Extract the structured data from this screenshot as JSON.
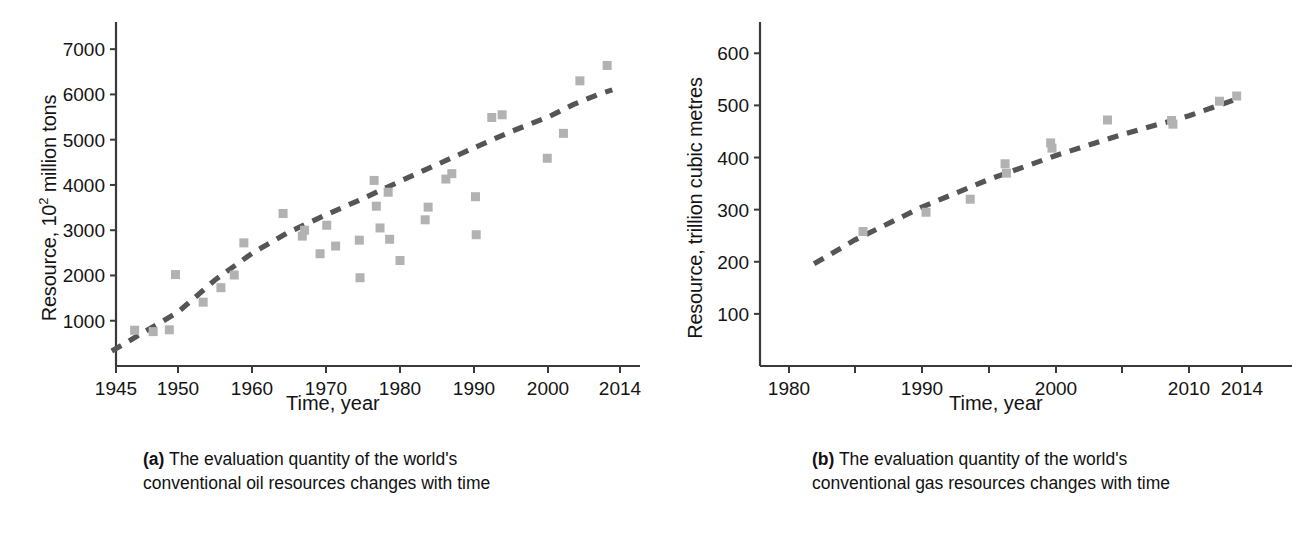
{
  "figure": {
    "panels": [
      {
        "id": "panel-a",
        "caption_tag": "(a)",
        "caption_text": " The evaluation quantity of the world's\nconventional oil resources changes with time",
        "chart_data": {
          "type": "scatter",
          "title": "",
          "xlabel": "Time, year",
          "ylabel_prefix": "Resource, 10",
          "ylabel_sup": "2",
          "ylabel_suffix": " million tons",
          "xlim": [
            1943,
            2018
          ],
          "ylim": [
            0,
            7600
          ],
          "grid": false,
          "legend": "none",
          "xticks": [
            1945,
            1950,
            1960,
            1970,
            1980,
            1990,
            2000,
            2014
          ],
          "xticklabels": [
            "1945",
            "1950",
            "1960",
            "1970",
            "1980",
            "1990",
            "2000",
            "2014"
          ],
          "yticks": [
            1000,
            2000,
            3000,
            4000,
            5000,
            6000,
            7000
          ],
          "yticklabels": [
            "1000",
            "2000",
            "3000",
            "4000",
            "5000",
            "6000",
            "7000"
          ],
          "marker": "square",
          "marker_color": "#b2b2b2",
          "trend_style": "dashed",
          "trend_color": "#555555",
          "points": [
            {
              "x": 1946.5,
              "y": 790
            },
            {
              "x": 1948.0,
              "y": 760
            },
            {
              "x": 1949.3,
              "y": 800
            },
            {
              "x": 1949.8,
              "y": 2020
            },
            {
              "x": 1953.4,
              "y": 1410
            },
            {
              "x": 1955.8,
              "y": 1730
            },
            {
              "x": 1957.6,
              "y": 2010
            },
            {
              "x": 1958.9,
              "y": 2720
            },
            {
              "x": 1964.2,
              "y": 3370
            },
            {
              "x": 1966.8,
              "y": 2870
            },
            {
              "x": 1967.1,
              "y": 3000
            },
            {
              "x": 1969.2,
              "y": 2480
            },
            {
              "x": 1970.1,
              "y": 3110
            },
            {
              "x": 1971.3,
              "y": 2650
            },
            {
              "x": 1974.5,
              "y": 2780
            },
            {
              "x": 1974.6,
              "y": 1950
            },
            {
              "x": 1976.5,
              "y": 4100
            },
            {
              "x": 1976.8,
              "y": 3530
            },
            {
              "x": 1977.3,
              "y": 3050
            },
            {
              "x": 1978.4,
              "y": 3840
            },
            {
              "x": 1978.6,
              "y": 2800
            },
            {
              "x": 1980.0,
              "y": 2330
            },
            {
              "x": 1983.4,
              "y": 3230
            },
            {
              "x": 1983.8,
              "y": 3510
            },
            {
              "x": 1986.2,
              "y": 4130
            },
            {
              "x": 1987.0,
              "y": 4250
            },
            {
              "x": 1990.2,
              "y": 3740
            },
            {
              "x": 1990.3,
              "y": 2900
            },
            {
              "x": 1992.4,
              "y": 5490
            },
            {
              "x": 1993.8,
              "y": 5550
            },
            {
              "x": 1999.9,
              "y": 4590
            },
            {
              "x": 2003.0,
              "y": 5140
            },
            {
              "x": 2006.2,
              "y": 6300
            },
            {
              "x": 2011.5,
              "y": 6640
            }
          ],
          "trend": [
            {
              "x": 1944.6,
              "y": 330
            },
            {
              "x": 1950.0,
              "y": 1190
            },
            {
              "x": 1955.0,
              "y": 1900
            },
            {
              "x": 1960.0,
              "y": 2490
            },
            {
              "x": 1965.0,
              "y": 2960
            },
            {
              "x": 1970.0,
              "y": 3340
            },
            {
              "x": 1975.0,
              "y": 3700
            },
            {
              "x": 1980.0,
              "y": 4080
            },
            {
              "x": 1985.0,
              "y": 4450
            },
            {
              "x": 1990.0,
              "y": 4820
            },
            {
              "x": 1995.0,
              "y": 5180
            },
            {
              "x": 2000.0,
              "y": 5500
            },
            {
              "x": 2005.0,
              "y": 5780
            },
            {
              "x": 2010.0,
              "y": 6010
            },
            {
              "x": 2012.5,
              "y": 6100
            }
          ]
        }
      },
      {
        "id": "panel-b",
        "caption_tag": "(b)",
        "caption_text": " The evaluation quantity of the world's\nconventional gas resources changes with time",
        "chart_data": {
          "type": "scatter",
          "title": "",
          "xlabel": "Time, year",
          "ylabel_prefix": "Resource, trillion cubic metres",
          "ylabel_sup": "",
          "ylabel_suffix": "",
          "xlim": [
            1976,
            2018
          ],
          "ylim": [
            0,
            660
          ],
          "grid": false,
          "legend": "none",
          "xticks": [
            1980,
            1985,
            1990,
            1995,
            2000,
            2005,
            2010,
            2014
          ],
          "xticklabels": [
            "1980",
            "",
            "1990",
            "",
            "2000",
            "",
            "2010",
            "2014"
          ],
          "yticks": [
            100,
            200,
            300,
            400,
            500,
            600
          ],
          "yticklabels": [
            "100",
            "200",
            "300",
            "400",
            "500",
            "600"
          ],
          "marker": "square",
          "marker_color": "#b2b2b2",
          "trend_style": "dashed",
          "trend_color": "#555555",
          "points": [
            {
              "x": 1985.6,
              "y": 258
            },
            {
              "x": 1990.3,
              "y": 295
            },
            {
              "x": 1993.6,
              "y": 320
            },
            {
              "x": 1996.2,
              "y": 388
            },
            {
              "x": 1996.3,
              "y": 370
            },
            {
              "x": 1999.6,
              "y": 428
            },
            {
              "x": 1999.7,
              "y": 418
            },
            {
              "x": 2003.9,
              "y": 472
            },
            {
              "x": 2008.7,
              "y": 471
            },
            {
              "x": 2008.8,
              "y": 464
            },
            {
              "x": 2012.3,
              "y": 508
            },
            {
              "x": 2013.6,
              "y": 518
            }
          ],
          "trend": [
            {
              "x": 1981.9,
              "y": 196
            },
            {
              "x": 1985.0,
              "y": 242
            },
            {
              "x": 1990.0,
              "y": 305
            },
            {
              "x": 1995.0,
              "y": 358
            },
            {
              "x": 2000.0,
              "y": 404
            },
            {
              "x": 2005.0,
              "y": 444
            },
            {
              "x": 2010.0,
              "y": 480
            },
            {
              "x": 2013.8,
              "y": 514
            }
          ]
        }
      }
    ]
  }
}
